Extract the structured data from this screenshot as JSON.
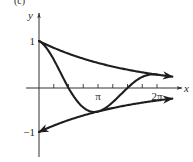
{
  "chart_data": {
    "type": "line",
    "title": "",
    "panel_label": "(c)",
    "xlabel": "x",
    "ylabel": "y",
    "xlim": [
      0,
      7.0
    ],
    "ylim": [
      -1.3,
      1.5
    ],
    "x_ticks": [
      {
        "value": 0.7854
      },
      {
        "value": 1.5708
      },
      {
        "value": 2.3562
      },
      {
        "value": 3.1416
      },
      {
        "value": 3.927
      },
      {
        "value": 4.7124
      },
      {
        "value": 5.4978
      },
      {
        "value": 6.2832
      }
    ],
    "x_tick_labels": [
      {
        "value": 3.1416,
        "label": "π"
      },
      {
        "value": 6.2832,
        "label": "2π"
      }
    ],
    "y_tick_labels": [
      {
        "value": 1,
        "label": "1"
      },
      {
        "value": -1,
        "label": "−1"
      }
    ],
    "grid": false,
    "legend": null,
    "series": [
      {
        "name": "upper envelope  y = e^(−x/5)",
        "formula": "exp(-x/5)",
        "x_range": [
          0,
          7.1
        ],
        "arrow_end": true,
        "arrow_start": false
      },
      {
        "name": "lower envelope  y = −e^(−x/5)",
        "formula": "-exp(-x/5)",
        "x_range": [
          0,
          7.1
        ],
        "arrow_end": true,
        "arrow_start": true
      },
      {
        "name": "damped curve  y = e^(−x/5)·cos x",
        "formula": "exp(-x/5)*cos(x)",
        "x_range": [
          0,
          6.2832
        ],
        "arrow_end": false,
        "arrow_start": false
      }
    ],
    "colors": {
      "curve": "#1e1e1e",
      "axis": "#333333",
      "text": "#2a2a2a"
    }
  }
}
